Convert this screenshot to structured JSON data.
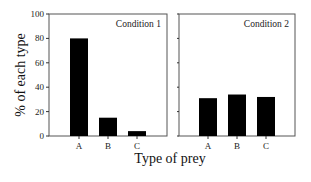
{
  "chart_data": {
    "type": "bar",
    "ylabel": "% of each type",
    "xlabel": "Type of prey",
    "ylim": [
      0,
      100
    ],
    "yticks": [
      0,
      20,
      40,
      60,
      80,
      100
    ],
    "grid": false,
    "legend": null,
    "categories": [
      "A",
      "B",
      "C"
    ],
    "panels": [
      {
        "title": "Condition 1",
        "values": [
          80,
          15,
          4
        ]
      },
      {
        "title": "Condition 2",
        "values": [
          31,
          34,
          32
        ]
      }
    ]
  }
}
